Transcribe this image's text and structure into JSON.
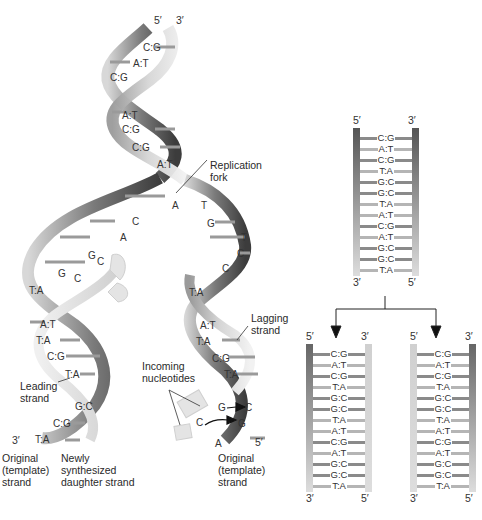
{
  "colors": {
    "strand_dark": "#4a4a4a",
    "strand_mid": "#8c8c8c",
    "strand_light": "#c8c8c8",
    "strand_pale": "#e2e2e2",
    "rung": "#9a9a9a",
    "arrow": "#111111"
  },
  "helix": {
    "top_ends": {
      "left": "5′",
      "right": "3′"
    },
    "parental_pairs": [
      "C:G",
      "A:T",
      "C:G",
      "A:T",
      "C:G",
      "C:G",
      "C:G",
      "A:T"
    ],
    "fork_label": "Replication\nfork",
    "left_unpaired": [
      "A",
      "C",
      "A",
      "G",
      "C",
      "G",
      "C"
    ],
    "right_unpaired": [
      "T",
      "G",
      "T",
      "C",
      "C"
    ],
    "leading_pairs": [
      "T:A",
      "A:T",
      "T:A",
      "C:G",
      "T:A",
      "G:C",
      "C:G",
      "T:A"
    ],
    "lagging_pairs": [
      "T:A",
      "A:T",
      "T:A",
      "C:G",
      "T:A"
    ],
    "incoming": [
      "G",
      "C",
      "C",
      "G"
    ],
    "incoming_label": "Incoming\nnucleotides",
    "leading_label": "Leading\nstrand",
    "lagging_label": "Lagging\nstrand",
    "bottom_left_end": "3′",
    "bottom_right_end": "5′",
    "bottom_right_base": "A",
    "original_left_label": "Original\n(template)\nstrand",
    "newly_label": "Newly\nsynthesized\ndaughter strand",
    "original_right_label": "Original\n(template)\nstrand"
  },
  "ladders": {
    "parent": {
      "top": {
        "left": "5′",
        "right": "3′"
      },
      "bottom": {
        "left": "3′",
        "right": "5′"
      },
      "pairs": [
        "C:G",
        "A:T",
        "C:G",
        "T:A",
        "G:C",
        "G:C",
        "T:A",
        "A:T",
        "C:G",
        "A:T",
        "G:C",
        "G:C",
        "T:A"
      ]
    },
    "daughter_left": {
      "top": {
        "left": "5′",
        "right": "3′"
      },
      "bottom": {
        "left": "3′",
        "right": "5′"
      },
      "pairs": [
        "C:G",
        "A:T",
        "C:G",
        "T:A",
        "G:C",
        "G:C",
        "T:A",
        "A:T",
        "C:G",
        "A:T",
        "G:C",
        "G:C",
        "T:A"
      ]
    },
    "daughter_right": {
      "top": {
        "left": "5′",
        "right": "3′"
      },
      "bottom": {
        "left": "3′",
        "right": "5′"
      },
      "pairs": [
        "C:G",
        "A:T",
        "C:G",
        "T:A",
        "G:C",
        "G:C",
        "T:A",
        "A:T",
        "C:G",
        "A:T",
        "G:C",
        "G:C",
        "T:A"
      ]
    }
  }
}
